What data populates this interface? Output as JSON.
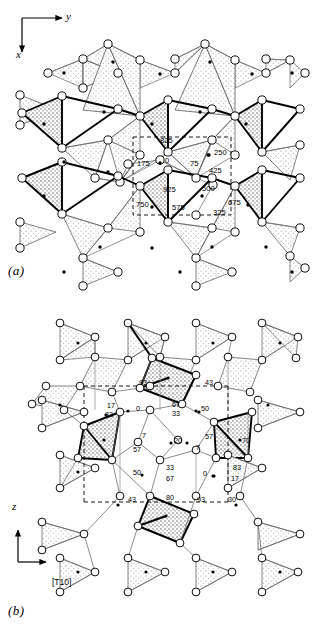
{
  "figure": {
    "type": "crystal-structure-projection",
    "panels": [
      {
        "id": "a",
        "caption": "(a)",
        "axes": {
          "horizontal": "y",
          "vertical": "x",
          "horizontal_dir": "right",
          "vertical_dir": "down"
        },
        "height_labels": [
          "825",
          "250",
          "175",
          "0",
          "75",
          "425",
          "925",
          "500",
          "750",
          "575",
          "675",
          "325"
        ],
        "labels": [
          {
            "text": "825",
            "x": 160,
            "y": 143
          },
          {
            "text": "250",
            "x": 214,
            "y": 155
          },
          {
            "text": "175",
            "x": 137,
            "y": 166
          },
          {
            "text": "0",
            "x": 165,
            "y": 163
          },
          {
            "text": "75",
            "x": 190,
            "y": 166
          },
          {
            "text": "425",
            "x": 209,
            "y": 173
          },
          {
            "text": "925",
            "x": 163,
            "y": 192
          },
          {
            "text": "500",
            "x": 202,
            "y": 191
          },
          {
            "text": "750",
            "x": 136,
            "y": 207
          },
          {
            "text": "575",
            "x": 172,
            "y": 210
          },
          {
            "text": "675",
            "x": 228,
            "y": 205
          },
          {
            "text": "325",
            "x": 213,
            "y": 215
          }
        ]
      },
      {
        "id": "b",
        "caption": "(b)",
        "axes": {
          "horizontal": "[T10]",
          "vertical": "z",
          "horizontal_dir": "right",
          "vertical_dir": "up"
        },
        "height_labels": [
          "93",
          "43",
          "17",
          "83",
          "0",
          "67",
          "33",
          "50",
          "7",
          "20",
          "57",
          "7",
          "70",
          "50",
          "33",
          "67",
          "0",
          "83",
          "17",
          "43",
          "80",
          "93",
          "30"
        ],
        "labels": [
          {
            "text": "93",
            "x": 139,
            "y": 385
          },
          {
            "text": "43",
            "x": 205,
            "y": 385
          },
          {
            "text": "17",
            "x": 107,
            "y": 408
          },
          {
            "text": "83",
            "x": 105,
            "y": 417
          },
          {
            "text": "0",
            "x": 136,
            "y": 411
          },
          {
            "text": "67",
            "x": 172,
            "y": 407
          },
          {
            "text": "33",
            "x": 172,
            "y": 416
          },
          {
            "text": "50",
            "x": 201,
            "y": 411
          },
          {
            "text": "7",
            "x": 142,
            "y": 438
          },
          {
            "text": "20",
            "x": 174,
            "y": 443
          },
          {
            "text": "57",
            "x": 205,
            "y": 439
          },
          {
            "text": "7",
            "x": 196,
            "y": 450
          },
          {
            "text": "70",
            "x": 242,
            "y": 443
          },
          {
            "text": "57",
            "x": 133,
            "y": 452
          },
          {
            "text": "33",
            "x": 166,
            "y": 470
          },
          {
            "text": "50",
            "x": 133,
            "y": 475
          },
          {
            "text": "67",
            "x": 166,
            "y": 481
          },
          {
            "text": "0",
            "x": 203,
            "y": 476
          },
          {
            "text": "83",
            "x": 233,
            "y": 470
          },
          {
            "text": "17",
            "x": 231,
            "y": 481
          },
          {
            "text": "43",
            "x": 128,
            "y": 502
          },
          {
            "text": "80",
            "x": 166,
            "y": 500
          },
          {
            "text": "93",
            "x": 197,
            "y": 502
          },
          {
            "text": "30",
            "x": 228,
            "y": 502
          }
        ]
      }
    ],
    "colors": {
      "ink": "#000000",
      "background": "#ffffff",
      "stipple_light": "#e9e9e9",
      "stipple_dark": "#c9c9c9",
      "thin_line": "#555555"
    },
    "legend_marks": {
      "open_circle": "atom-open-circle",
      "filled_dot": "atom-filled-dot",
      "stippled_polygon": "coordination-tetrahedron",
      "dashed_rectangle": "unit-cell-outline"
    }
  }
}
